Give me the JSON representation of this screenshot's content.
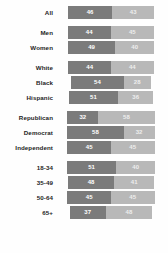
{
  "chart_data": {
    "type": "bar",
    "title": "",
    "subtitle": "",
    "xlabel": "",
    "ylabel": "",
    "orientation": "horizontal",
    "stacked": true,
    "centered_baseline": true,
    "grid": false,
    "legend_position": "none",
    "xlim": [
      0,
      100
    ],
    "series": [
      {
        "name": "left-segment",
        "color": "#7b7b7b"
      },
      {
        "name": "right-segment",
        "color": "#b8b8b8"
      }
    ],
    "groups": [
      {
        "name": "overall",
        "rows": [
          {
            "label": "All",
            "left": 46,
            "right": 43
          }
        ]
      },
      {
        "name": "gender",
        "rows": [
          {
            "label": "Men",
            "left": 44,
            "right": 45
          },
          {
            "label": "Women",
            "left": 49,
            "right": 40
          }
        ]
      },
      {
        "name": "race",
        "rows": [
          {
            "label": "White",
            "left": 44,
            "right": 44
          },
          {
            "label": "Black",
            "left": 54,
            "right": 28
          },
          {
            "label": "Hispanic",
            "left": 51,
            "right": 36
          }
        ]
      },
      {
        "name": "party",
        "rows": [
          {
            "label": "Republican",
            "left": 32,
            "right": 58
          },
          {
            "label": "Democrat",
            "left": 58,
            "right": 32
          },
          {
            "label": "Independent",
            "left": 45,
            "right": 45
          }
        ]
      },
      {
        "name": "age",
        "rows": [
          {
            "label": "18-34",
            "left": 51,
            "right": 40
          },
          {
            "label": "35-49",
            "left": 48,
            "right": 41
          },
          {
            "label": "50-64",
            "left": 45,
            "right": 45
          },
          {
            "label": "65+",
            "left": 37,
            "right": 48
          }
        ]
      }
    ]
  },
  "colors": {
    "left_segment": "#7b7b7b",
    "right_segment": "#b8b8b8",
    "label_text": "#1d1d1d",
    "value_text": "#ffffff",
    "background": "#fefefe"
  }
}
